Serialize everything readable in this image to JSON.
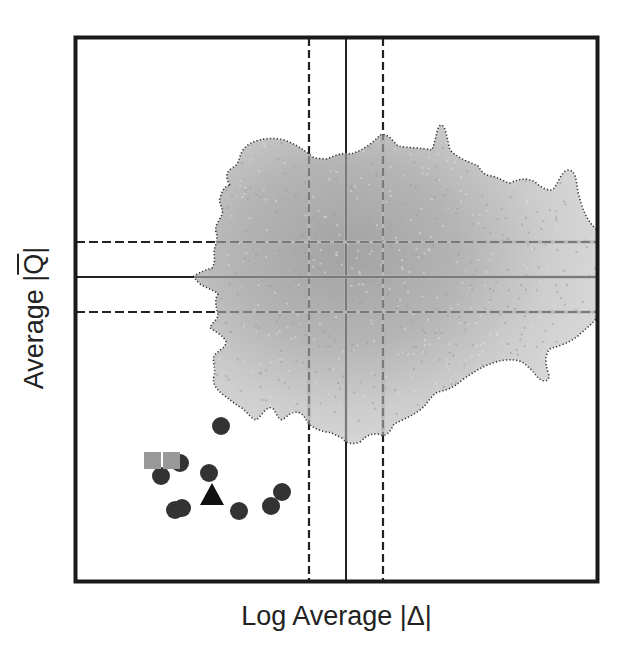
{
  "chart_data": {
    "type": "scatter",
    "title": "",
    "xlabel": "Log Average |Δ|",
    "ylabel": "Average |Q̄|",
    "ylabel_parts": {
      "prefix": "Average |",
      "symbol": "Q",
      "suffix": "|"
    },
    "grid": false,
    "ticks": "none",
    "legend": "none",
    "background_density": {
      "description": "Gray density cloud of background points with dotted outline, darker toward center",
      "center_x_px": 346,
      "center_y_px": 277,
      "fill_color_light": "#d0d0d0",
      "fill_color_dark": "#a6a6a6",
      "outline_style": "dotted",
      "outline_color": "#333333"
    },
    "reference_lines": {
      "vertical": [
        {
          "style": "dashed",
          "role": "x_mean_minus_sd",
          "x_px": 309
        },
        {
          "style": "solid",
          "role": "x_mean",
          "x_px": 346
        },
        {
          "style": "dashed",
          "role": "x_mean_plus_sd",
          "x_px": 383
        }
      ],
      "horizontal": [
        {
          "style": "dashed",
          "role": "y_mean_plus_sd",
          "y_px": 242
        },
        {
          "style": "solid",
          "role": "y_mean",
          "y_px": 277
        },
        {
          "style": "dashed",
          "role": "y_mean_minus_sd",
          "y_px": 312
        }
      ]
    },
    "series": [
      {
        "name": "circles",
        "marker": "circle",
        "color": "#333333",
        "points_px": [
          [
            221,
            426
          ],
          [
            161,
            476
          ],
          [
            180,
            463
          ],
          [
            209,
            473
          ],
          [
            175,
            510
          ],
          [
            182,
            508
          ],
          [
            239,
            511
          ],
          [
            271,
            506
          ],
          [
            282,
            492
          ]
        ]
      },
      {
        "name": "squares",
        "marker": "square",
        "color": "#999999",
        "points_px": [
          [
            153,
            461
          ],
          [
            172,
            461
          ]
        ]
      },
      {
        "name": "triangle",
        "marker": "triangle",
        "color": "#111111",
        "points_px": [
          [
            212,
            496
          ]
        ]
      }
    ],
    "plot_area_px": {
      "left": 74,
      "top": 36,
      "right": 599,
      "bottom": 583
    }
  }
}
